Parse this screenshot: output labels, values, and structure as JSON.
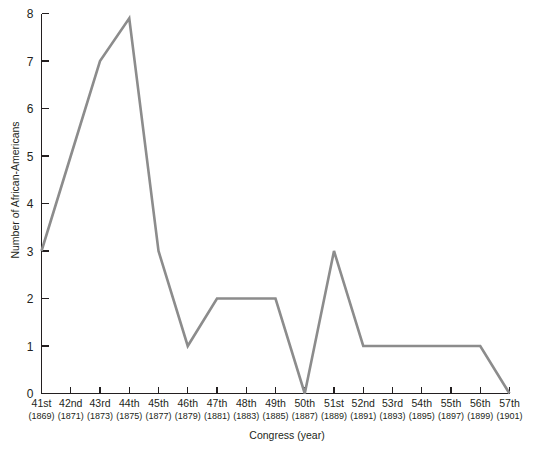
{
  "chart_data": {
    "type": "line",
    "title": "",
    "xlabel": "Congress (year)",
    "ylabel": "Number of African-Americans",
    "categories": [
      "41st",
      "42nd",
      "43rd",
      "44th",
      "45th",
      "46th",
      "47th",
      "48th",
      "49th",
      "50th",
      "51st",
      "52nd",
      "53rd",
      "54th",
      "55th",
      "56th",
      "57th"
    ],
    "tick_years": [
      "(1869)",
      "(1871)",
      "(1873)",
      "(1875)",
      "(1877)",
      "(1879)",
      "(1881)",
      "(1883)",
      "(1885)",
      "(1887)",
      "(1889)",
      "(1891)",
      "(1893)",
      "(1895)",
      "(1897)",
      "(1899)",
      "(1901)"
    ],
    "values": [
      3,
      5,
      7,
      7.9,
      3,
      1,
      2,
      2,
      2,
      0,
      3,
      1,
      1,
      1,
      1,
      1,
      0
    ],
    "ylim": [
      0,
      8
    ],
    "ytick_labels": [
      "0",
      "1",
      "2",
      "3",
      "4",
      "5",
      "6",
      "7",
      "8"
    ],
    "ytick_values": [
      0,
      1,
      2,
      3,
      4,
      5,
      6,
      7,
      8
    ],
    "grid": false,
    "legend": "none",
    "series_color": "#8c8c8c",
    "axis_color": "#231f20",
    "background_color": "#ffffff"
  }
}
